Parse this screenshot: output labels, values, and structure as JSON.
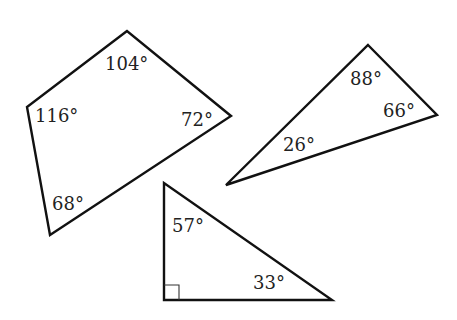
{
  "figure": {
    "width": 457,
    "height": 320,
    "stroke_color": "#111111",
    "text_color": "#222222"
  },
  "quadrilateral": {
    "points": "127,31 27,107 50,235 231,116",
    "angles": [
      {
        "vertex": "top",
        "label": "104°",
        "x": 105,
        "y": 55
      },
      {
        "vertex": "left",
        "label": "116°",
        "x": 35,
        "y": 107
      },
      {
        "vertex": "right",
        "label": "72°",
        "x": 181,
        "y": 111
      },
      {
        "vertex": "bottom",
        "label": "68°",
        "x": 52,
        "y": 195
      }
    ]
  },
  "obtuse_triangle": {
    "points": "368,45 437,115 226,185",
    "angles": [
      {
        "vertex": "top",
        "label": "88°",
        "x": 350,
        "y": 70
      },
      {
        "vertex": "right",
        "label": "66°",
        "x": 383,
        "y": 102
      },
      {
        "vertex": "left",
        "label": "26°",
        "x": 283,
        "y": 136
      }
    ]
  },
  "right_triangle": {
    "points": "164,183 164,300 332,300",
    "right_angle_mark": "164,285 179,285 179,300",
    "angles": [
      {
        "vertex": "top",
        "label": "57°",
        "x": 172,
        "y": 217
      },
      {
        "vertex": "bottom-right",
        "label": "33°",
        "x": 253,
        "y": 274
      },
      {
        "vertex": "bottom-left",
        "label": "",
        "x": 0,
        "y": 0
      }
    ]
  }
}
